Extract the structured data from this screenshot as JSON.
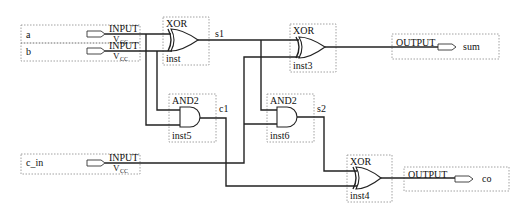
{
  "inputs": [
    {
      "name": "a",
      "type": "INPUT",
      "sub": "V",
      "subscript": "CC"
    },
    {
      "name": "b",
      "type": "INPUT",
      "sub": "V",
      "subscript": "CC"
    },
    {
      "name": "c_in",
      "type": "INPUT",
      "sub": "V",
      "subscript": "CC"
    }
  ],
  "gates": [
    {
      "type": "XOR",
      "inst": "inst",
      "out_net": "s1"
    },
    {
      "type": "AND2",
      "inst": "inst5",
      "out_net": "c1"
    },
    {
      "type": "XOR",
      "inst": "inst3",
      "out_net": ""
    },
    {
      "type": "AND2",
      "inst": "inst6",
      "out_net": "s2"
    },
    {
      "type": "XOR",
      "inst": "inst4",
      "out_net": ""
    }
  ],
  "outputs": [
    {
      "name": "sum",
      "type": "OUTPUT"
    },
    {
      "name": "co",
      "type": "OUTPUT"
    }
  ],
  "colors": {
    "wire": "#222222",
    "box": "#8a8a8a",
    "background": "#ffffff"
  }
}
